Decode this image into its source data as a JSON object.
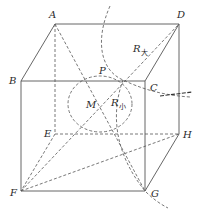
{
  "diagram": {
    "type": "cube-with-spheres",
    "vertices": {
      "A": {
        "label": "A",
        "x": 55,
        "y": 24
      },
      "B": {
        "label": "B",
        "x": 21,
        "y": 81
      },
      "C": {
        "label": "C",
        "x": 145,
        "y": 81
      },
      "D": {
        "label": "D",
        "x": 179,
        "y": 24
      },
      "E": {
        "label": "E",
        "x": 55,
        "y": 134
      },
      "F": {
        "label": "F",
        "x": 21,
        "y": 191
      },
      "G": {
        "label": "G",
        "x": 145,
        "y": 191
      },
      "H": {
        "label": "H",
        "x": 179,
        "y": 134
      }
    },
    "points": {
      "P": {
        "label": "P",
        "x": 123,
        "y": 80
      },
      "M": {
        "label": "M",
        "x": 100,
        "y": 104
      }
    },
    "radius_labels": {
      "large": {
        "main": "R",
        "sub": "大"
      },
      "small": {
        "main": "R",
        "sub": "小"
      }
    },
    "colors": {
      "line": "#555555",
      "text": "#2a2a2a",
      "background": "#ffffff"
    }
  }
}
